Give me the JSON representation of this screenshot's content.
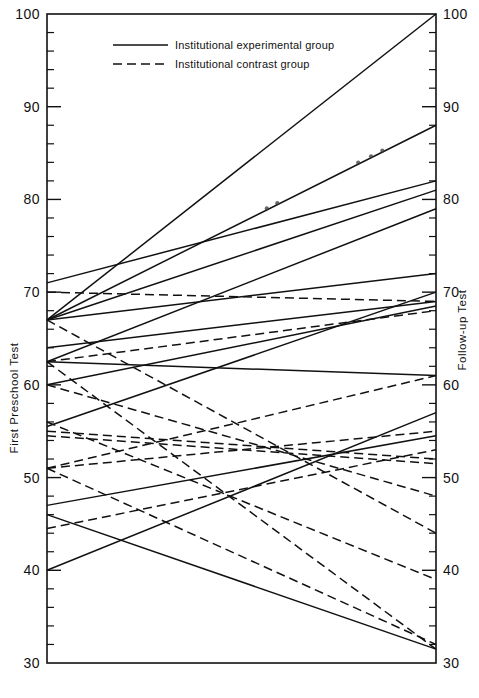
{
  "chart_data": {
    "type": "line",
    "title": "",
    "subtitle": "",
    "ylabel_left": "First Preschool Test",
    "ylabel_right": "Follow-up Test",
    "xlabel": "",
    "ylim": [
      30,
      100
    ],
    "y_major_ticks": [
      30,
      40,
      50,
      60,
      70,
      80,
      90,
      100
    ],
    "y_major_tick_labels": [
      "30",
      "40",
      "50",
      "60",
      "70",
      "80",
      "90",
      "100"
    ],
    "y_minor_tick_step": 2,
    "grid": false,
    "x": [
      "First Preschool Test",
      "Follow-up Test"
    ],
    "legend": {
      "position": "top-center",
      "entries": [
        {
          "label": "Institutional experimental group",
          "style": "solid"
        },
        {
          "label": "Institutional contrast group",
          "style": "dashed"
        }
      ]
    },
    "series": [
      {
        "name": "exp-1",
        "style": "solid",
        "values": [
          67.0,
          100.0
        ]
      },
      {
        "name": "exp-2",
        "style": "solid",
        "values": [
          67.0,
          88.0
        ]
      },
      {
        "name": "exp-3",
        "style": "solid",
        "values": [
          71.0,
          82.0
        ]
      },
      {
        "name": "exp-4",
        "style": "solid",
        "values": [
          67.0,
          81.0
        ]
      },
      {
        "name": "exp-5",
        "style": "solid",
        "values": [
          62.5,
          79.0
        ]
      },
      {
        "name": "exp-6",
        "style": "solid",
        "values": [
          67.0,
          72.0
        ]
      },
      {
        "name": "exp-7",
        "style": "solid",
        "values": [
          55.5,
          70.0
        ]
      },
      {
        "name": "exp-8",
        "style": "solid",
        "values": [
          64.0,
          69.0
        ]
      },
      {
        "name": "exp-9",
        "style": "solid",
        "values": [
          60.0,
          68.5
        ]
      },
      {
        "name": "exp-10",
        "style": "solid",
        "values": [
          62.5,
          61.0
        ]
      },
      {
        "name": "exp-11",
        "style": "solid",
        "values": [
          40.0,
          57.0
        ]
      },
      {
        "name": "exp-12",
        "style": "solid",
        "values": [
          47.0,
          54.5
        ]
      },
      {
        "name": "exp-13",
        "style": "solid",
        "values": [
          46.0,
          31.5
        ]
      },
      {
        "name": "ctr-1",
        "style": "dashed",
        "values": [
          70.0,
          69.0
        ]
      },
      {
        "name": "ctr-2",
        "style": "dashed",
        "values": [
          62.5,
          68.0
        ]
      },
      {
        "name": "ctr-3",
        "style": "dashed",
        "values": [
          51.0,
          61.0
        ]
      },
      {
        "name": "ctr-4",
        "style": "dashed",
        "values": [
          51.0,
          55.0
        ]
      },
      {
        "name": "ctr-5",
        "style": "dashed",
        "values": [
          44.5,
          53.0
        ]
      },
      {
        "name": "ctr-6",
        "style": "dashed",
        "values": [
          55.0,
          52.0
        ]
      },
      {
        "name": "ctr-7",
        "style": "dashed",
        "values": [
          54.5,
          51.5
        ]
      },
      {
        "name": "ctr-8",
        "style": "dashed",
        "values": [
          60.0,
          48.0
        ]
      },
      {
        "name": "ctr-9",
        "style": "dashed",
        "values": [
          67.0,
          44.0
        ]
      },
      {
        "name": "ctr-10",
        "style": "dashed",
        "values": [
          56.0,
          39.0
        ]
      },
      {
        "name": "ctr-11",
        "style": "dashed",
        "values": [
          62.5,
          31.5
        ]
      },
      {
        "name": "ctr-12",
        "style": "dashed",
        "values": [
          51.0,
          32.0
        ]
      }
    ],
    "annotations": [
      {
        "type": "dot-cluster",
        "near_series": "exp-2",
        "count": 2,
        "note": "ink specks on upper solid line"
      },
      {
        "type": "dot-cluster",
        "near_series": "exp-2",
        "count": 3,
        "note": "ink specks on upper solid line"
      }
    ]
  }
}
